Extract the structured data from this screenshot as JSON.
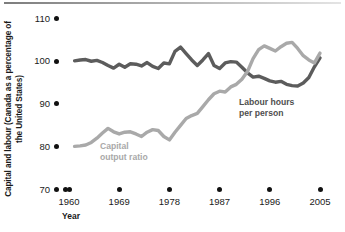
{
  "chart_data": {
    "type": "line",
    "title": "",
    "xlabel": "Year",
    "ylabel": "Capital and labour (Canada as a percentage of the United States)",
    "xlim": [
      1960,
      2005
    ],
    "ylim": [
      70,
      110
    ],
    "ytick_labels": [
      "110",
      "100",
      "90",
      "80",
      "70"
    ],
    "ytick_values": [
      110,
      100,
      90,
      80,
      70
    ],
    "xtick_labels": [
      "1960",
      "1969",
      "1978",
      "1987",
      "1996",
      "2005"
    ],
    "xtick_values": [
      1960,
      1969,
      1978,
      1987,
      1996,
      2005
    ],
    "grid": false,
    "legend": "inline-annotations",
    "series": [
      {
        "name": "Labour hours per person",
        "color": "#5c5c5c",
        "x": [
          1961,
          1962,
          1963,
          1964,
          1965,
          1966,
          1967,
          1968,
          1969,
          1970,
          1971,
          1972,
          1973,
          1974,
          1975,
          1976,
          1977,
          1978,
          1979,
          1980,
          1981,
          1982,
          1983,
          1984,
          1985,
          1986,
          1987,
          1988,
          1989,
          1990,
          1991,
          1992,
          1993,
          1994,
          1995,
          1996,
          1997,
          1998,
          1999,
          2000,
          2001,
          2002,
          2003,
          2004,
          2005
        ],
        "values": [
          100.1,
          100.3,
          100.4,
          100.0,
          100.2,
          99.7,
          99.0,
          98.4,
          99.3,
          98.6,
          99.4,
          99.3,
          98.9,
          99.7,
          98.8,
          98.3,
          99.6,
          99.4,
          102.3,
          103.3,
          101.8,
          100.3,
          99.0,
          100.3,
          101.8,
          99.0,
          98.3,
          99.6,
          99.9,
          99.8,
          98.6,
          97.3,
          96.3,
          96.5,
          96.0,
          95.4,
          95.1,
          95.3,
          94.6,
          94.3,
          94.2,
          94.9,
          96.2,
          98.7,
          100.8
        ]
      },
      {
        "name": "Capital output ratio",
        "color": "#a9a9a9",
        "x": [
          1961,
          1962,
          1963,
          1964,
          1965,
          1966,
          1967,
          1968,
          1969,
          1970,
          1971,
          1972,
          1973,
          1974,
          1975,
          1976,
          1977,
          1978,
          1979,
          1980,
          1981,
          1982,
          1983,
          1984,
          1985,
          1986,
          1987,
          1988,
          1989,
          1990,
          1991,
          1992,
          1993,
          1994,
          1995,
          1996,
          1997,
          1998,
          1999,
          2000,
          2001,
          2002,
          2003,
          2004,
          2005
        ],
        "values": [
          80.1,
          80.2,
          80.4,
          81.0,
          82.0,
          83.2,
          84.3,
          83.5,
          83.0,
          83.4,
          83.5,
          83.0,
          82.4,
          83.4,
          84.0,
          83.8,
          82.4,
          81.6,
          83.4,
          85.0,
          86.6,
          87.3,
          87.8,
          89.4,
          91.0,
          92.4,
          93.0,
          92.8,
          94.0,
          94.6,
          95.8,
          97.6,
          100.6,
          102.7,
          103.6,
          103.0,
          102.4,
          103.4,
          104.2,
          104.4,
          103.0,
          101.3,
          100.3,
          99.6,
          101.9
        ]
      }
    ],
    "annotations": [
      {
        "text_line1": "Labour hours",
        "text_line2": "per person",
        "series": "Labour hours per person"
      },
      {
        "text_line1": "Capital",
        "text_line2": "output ratio",
        "series": "Capital output ratio"
      }
    ]
  }
}
